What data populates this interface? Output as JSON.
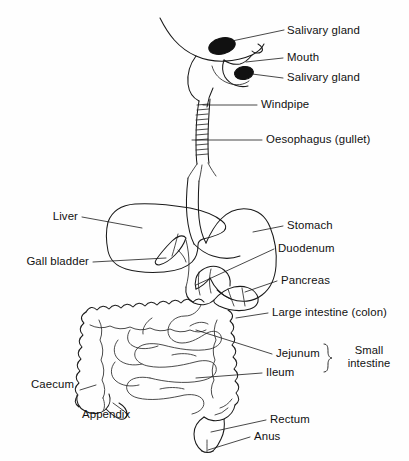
{
  "diagram": {
    "background_color": "#fefefe",
    "line_color": "#1a1a1a",
    "gland_fill": "#111111"
  },
  "labels": {
    "salivary_gland_upper": "Salivary gland",
    "mouth": "Mouth",
    "salivary_gland_lower": "Salivary gland",
    "windpipe": "Windpipe",
    "oesophagus": "Oesophagus (gullet)",
    "liver": "Liver",
    "gall_bladder": "Gall bladder",
    "stomach": "Stomach",
    "duodenum": "Duodenum",
    "pancreas": "Pancreas",
    "large_intestine": "Large intestine (colon)",
    "jejunum": "Jejunum",
    "ileum": "Ileum",
    "small_intestine": "Small\nintestine",
    "small_intestine_line1": "Small",
    "small_intestine_line2": "intestine",
    "caecum": "Caecum",
    "appendix": "Appendix",
    "rectum": "Rectum",
    "anus": "Anus"
  },
  "icons": {
    "salivary_gland_upper": "filled-ellipse-icon",
    "salivary_gland_lower": "filled-ellipse-icon",
    "brace": "curly-brace-icon"
  }
}
